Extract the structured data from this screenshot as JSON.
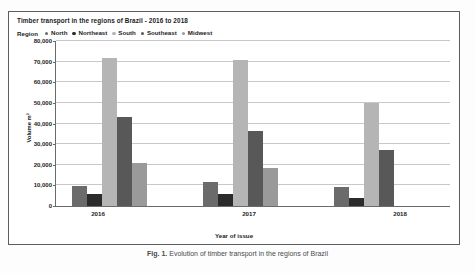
{
  "chart_data": {
    "type": "bar",
    "title": "Timber transport in the regions of Brazil - 2016 to 2018",
    "xlabel": "Year of issue",
    "ylabel": "Volume m³",
    "categories": [
      "2016",
      "2017",
      "2018"
    ],
    "legend_title": "Region",
    "legend_position": "top-left",
    "grid": true,
    "ylim": [
      0,
      80000
    ],
    "yticks": [
      0,
      10000,
      20000,
      30000,
      40000,
      50000,
      60000,
      70000,
      80000
    ],
    "ytick_labels": [
      "0",
      "10,000",
      "20,000",
      "30,000",
      "40,000",
      "50,000",
      "60,000",
      "70,000",
      "80,000"
    ],
    "series": [
      {
        "name": "North",
        "color": "#6b6b6b",
        "values": [
          9500,
          11500,
          9000
        ]
      },
      {
        "name": "Northeast",
        "color": "#2b2b2b",
        "values": [
          6000,
          6000,
          4000
        ]
      },
      {
        "name": "South",
        "color": "#b5b5b5",
        "values": [
          72000,
          71000,
          50000
        ]
      },
      {
        "name": "Southeast",
        "color": "#585858",
        "values": [
          43000,
          36500,
          27000
        ]
      },
      {
        "name": "Midwest",
        "color": "#9a9a9a",
        "values": [
          21000,
          18500,
          0
        ]
      }
    ]
  },
  "caption": {
    "figure_label": "Fig. 1.",
    "text": "Evolution of timber transport in the regions of Brazil"
  }
}
